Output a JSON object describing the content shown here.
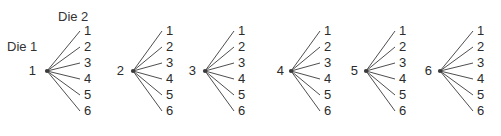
{
  "figure": {
    "title_visible": false,
    "background_color": "#ffffff",
    "ink_color": "#3a3a3a",
    "text_color": "#2b2b2b"
  },
  "annotations": {
    "die1_label": "Die 1",
    "die2_label": "Die 2"
  },
  "chart_data": {
    "type": "diagram",
    "subtype": "tree-diagram-fan-set",
    "title": "",
    "xlabel": "",
    "ylabel": "",
    "grid": false,
    "legend": false,
    "annotations": [
      "Die 1",
      "Die 2"
    ],
    "root_values": [
      "1",
      "2",
      "3",
      "4",
      "5",
      "6"
    ],
    "leaf_values": [
      "1",
      "2",
      "3",
      "4",
      "5",
      "6"
    ],
    "branches_per_root": 6,
    "total_outcomes": 36,
    "trees": [
      {
        "root": "1",
        "leaves": [
          "1",
          "2",
          "3",
          "4",
          "5",
          "6"
        ]
      },
      {
        "root": "2",
        "leaves": [
          "1",
          "2",
          "3",
          "4",
          "5",
          "6"
        ]
      },
      {
        "root": "3",
        "leaves": [
          "1",
          "2",
          "3",
          "4",
          "5",
          "6"
        ]
      },
      {
        "root": "4",
        "leaves": [
          "1",
          "2",
          "3",
          "4",
          "5",
          "6"
        ]
      },
      {
        "root": "5",
        "leaves": [
          "1",
          "2",
          "3",
          "4",
          "5",
          "6"
        ]
      },
      {
        "root": "6",
        "leaves": [
          "1",
          "2",
          "3",
          "4",
          "5",
          "6"
        ]
      }
    ]
  },
  "geometry": {
    "leaf_y": [
      31,
      47,
      63,
      79,
      95,
      111
    ],
    "vertex_y": 71,
    "trees": [
      {
        "root_x": 30,
        "vertex_x": 47,
        "leaf_x": 84
      },
      {
        "root_x": 118,
        "vertex_x": 133,
        "leaf_x": 166
      },
      {
        "root_x": 190,
        "vertex_x": 205,
        "leaf_x": 238
      },
      {
        "root_x": 278,
        "vertex_x": 291,
        "leaf_x": 324
      },
      {
        "root_x": 352,
        "vertex_x": 366,
        "leaf_x": 399
      },
      {
        "root_x": 426,
        "vertex_x": 440,
        "leaf_x": 477
      }
    ]
  }
}
